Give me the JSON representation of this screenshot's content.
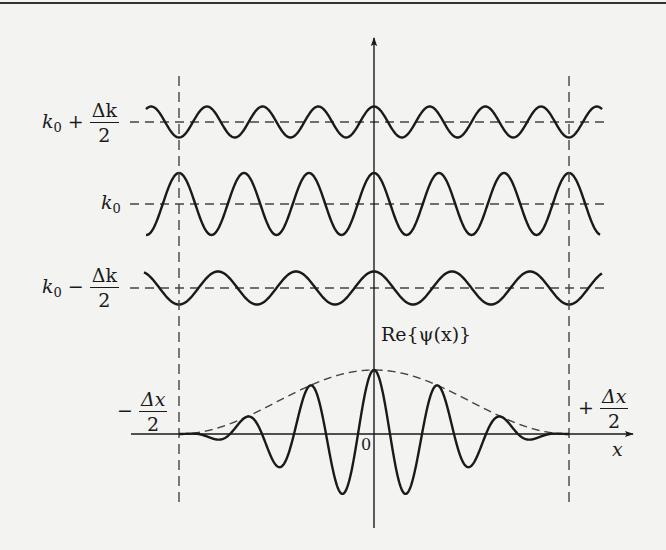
{
  "figure": {
    "background": "#f3f3f1",
    "ink": "#1a1a1a",
    "dash_color": "#444444",
    "top_rule_y": 3,
    "axes": {
      "origin": {
        "x": 374,
        "y": 434
      },
      "x_axis": {
        "from": 131,
        "to": 633,
        "label": "x"
      },
      "y_axis": {
        "from": 528,
        "to": 38
      },
      "origin_label": "0"
    },
    "bounds": {
      "left_x": 179,
      "right_x": 569,
      "dash_top": 76,
      "dash_bottom": 502,
      "left_label": {
        "sign": "−",
        "numerator": "Δx",
        "denominator": "2"
      },
      "right_label": {
        "sign": "+",
        "numerator": "Δx",
        "denominator": "2"
      }
    },
    "components": [
      {
        "name": "upper",
        "label": {
          "base": "k",
          "sub": "0",
          "op": "+",
          "numerator": "Δk",
          "denominator": "2"
        },
        "center_y": 122,
        "amplitude": 15.5,
        "period": 55.7,
        "x_start": 146,
        "x_end": 602,
        "dash_start": 130,
        "dash_end": 604
      },
      {
        "name": "center",
        "label": {
          "base": "k",
          "sub": "0"
        },
        "center_y": 204,
        "amplitude": 31,
        "period": 65,
        "x_start": 146,
        "x_end": 600,
        "dash_start": 130,
        "dash_end": 604
      },
      {
        "name": "lower",
        "label": {
          "base": "k",
          "sub": "0",
          "op": "−",
          "numerator": "Δk",
          "denominator": "2"
        },
        "center_y": 288,
        "amplitude": 16.5,
        "period": 78,
        "x_start": 144,
        "x_end": 602,
        "dash_start": 130,
        "dash_end": 604
      }
    ],
    "packet": {
      "label": "Re{ψ(x)}",
      "amplitude": 64,
      "carrier_period": 64,
      "half_width": 195,
      "x_start": 179,
      "x_end": 569
    }
  }
}
